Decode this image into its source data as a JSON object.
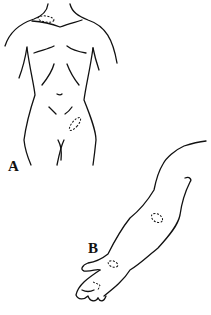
{
  "figure": {
    "panels": [
      {
        "id": "A",
        "label": "A",
        "subject": "female torso front view",
        "marked_sites": [
          "left supraclavicular/neck base",
          "right lower abdomen/groin"
        ]
      },
      {
        "id": "B",
        "label": "B",
        "subject": "outstretched arm and hand",
        "marked_sites": [
          "elbow",
          "wrist",
          "palm"
        ]
      }
    ],
    "colors": {
      "line": "#111111",
      "background": "#ffffff"
    }
  }
}
